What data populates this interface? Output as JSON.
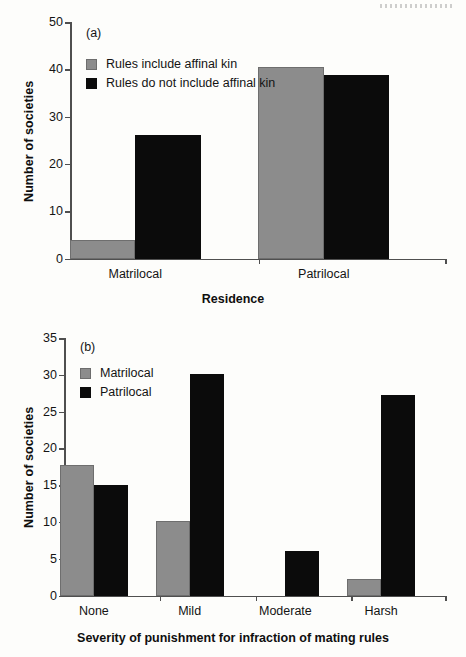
{
  "figure": {
    "background_color": "#fdfdfb",
    "gray_color": "#8c8c8c",
    "black_color": "#0b0b0b",
    "axis_color": "#4f4f4f"
  },
  "panel_a": {
    "tag": "(a)",
    "ylabel": "Number of societies",
    "xlabel": "Residence",
    "yticks": [
      "0",
      "10",
      "20",
      "30",
      "40",
      "50"
    ],
    "xticklabels": [
      "Matrilocal",
      "Patrilocal"
    ],
    "legend": [
      {
        "label": "Rules include affinal kin",
        "color": "#8c8c8c"
      },
      {
        "label": "Rules do not include affinal kin",
        "color": "#0b0b0b"
      }
    ]
  },
  "panel_b": {
    "tag": "(b)",
    "ylabel": "Number of societies",
    "xlabel": "Severity of punishment for infraction of mating rules",
    "yticks": [
      "0",
      "5",
      "10",
      "15",
      "20",
      "25",
      "30",
      "35"
    ],
    "xticklabels": [
      "None",
      "Mild",
      "Moderate",
      "Harsh"
    ],
    "legend": [
      {
        "label": "Matrilocal",
        "color": "#8c8c8c"
      },
      {
        "label": "Patrilocal",
        "color": "#0b0b0b"
      }
    ]
  },
  "chart_data": [
    {
      "type": "bar",
      "panel": "(a)",
      "title": "",
      "xlabel": "Residence",
      "ylabel": "Number of societies",
      "categories": [
        "Matrilocal",
        "Patrilocal"
      ],
      "series": [
        {
          "name": "Rules include affinal kin",
          "color": "#8c8c8c",
          "values": [
            4,
            40.5
          ]
        },
        {
          "name": "Rules do not include affinal kin",
          "color": "#0b0b0b",
          "values": [
            26.2,
            38.7
          ]
        }
      ],
      "ylim": [
        0,
        50
      ],
      "yticks": [
        0,
        10,
        20,
        30,
        40,
        50
      ],
      "grid": false,
      "legend_position": "upper-left"
    },
    {
      "type": "bar",
      "panel": "(b)",
      "title": "",
      "xlabel": "Severity of punishment for infraction of mating rules",
      "ylabel": "Number of societies",
      "categories": [
        "None",
        "Mild",
        "Moderate",
        "Harsh"
      ],
      "series": [
        {
          "name": "Matrilocal",
          "color": "#8c8c8c",
          "values": [
            17.8,
            10.1,
            0,
            2.2
          ]
        },
        {
          "name": "Patrilocal",
          "color": "#0b0b0b",
          "values": [
            15.0,
            30.1,
            6.1,
            27.2
          ]
        }
      ],
      "ylim": [
        0,
        35
      ],
      "yticks": [
        0,
        5,
        10,
        15,
        20,
        25,
        30,
        35
      ],
      "grid": false,
      "legend_position": "upper-left"
    }
  ]
}
